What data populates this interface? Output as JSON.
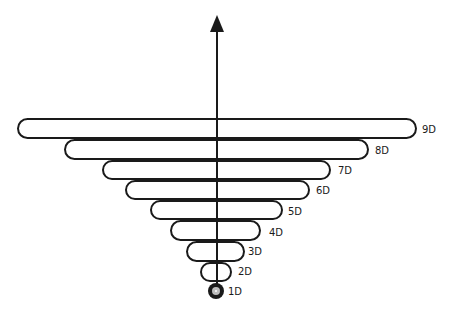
{
  "diagram": {
    "type": "inverted-stacked-capsule-hierarchy",
    "axis": {
      "direction": "up",
      "arrow": "arrow-up-icon"
    },
    "levels": [
      {
        "id": "9D",
        "label": "9D",
        "left": 17,
        "top": 118,
        "width": 400,
        "height": 21,
        "label_x": 422,
        "label_y": 125
      },
      {
        "id": "8D",
        "label": "8D",
        "left": 64,
        "top": 139,
        "width": 305,
        "height": 21,
        "label_x": 375,
        "label_y": 146
      },
      {
        "id": "7D",
        "label": "7D",
        "left": 102,
        "top": 160,
        "width": 229,
        "height": 20,
        "label_x": 338,
        "label_y": 166
      },
      {
        "id": "6D",
        "label": "6D",
        "left": 125,
        "top": 180,
        "width": 185,
        "height": 20,
        "label_x": 316,
        "label_y": 186
      },
      {
        "id": "5D",
        "label": "5D",
        "left": 150,
        "top": 200,
        "width": 133,
        "height": 20,
        "label_x": 288,
        "label_y": 207
      },
      {
        "id": "4D",
        "label": "4D",
        "left": 170,
        "top": 220,
        "width": 91,
        "height": 21,
        "label_x": 269,
        "label_y": 228
      },
      {
        "id": "3D",
        "label": "3D",
        "left": 186,
        "top": 241,
        "width": 59,
        "height": 21,
        "label_x": 248,
        "label_y": 247
      },
      {
        "id": "2D",
        "label": "2D",
        "left": 200,
        "top": 262,
        "width": 32,
        "height": 20,
        "label_x": 238,
        "label_y": 267
      }
    ],
    "core": {
      "id": "1D",
      "label": "1D",
      "label_x": 228,
      "label_y": 287
    },
    "colors": {
      "stroke": "#1a1a1a",
      "background": "#ffffff",
      "core_ring": "#bdbdbd"
    }
  }
}
